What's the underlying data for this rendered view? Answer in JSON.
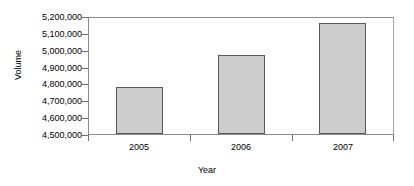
{
  "chart_data": {
    "type": "bar",
    "title": "",
    "xlabel": "Year",
    "ylabel": "Volume",
    "categories": [
      "2005",
      "2006",
      "2007"
    ],
    "values": [
      4783000,
      4978000,
      5170000
    ],
    "series": [
      {
        "name": "Volume",
        "values": [
          4783000,
          4978000,
          5170000
        ]
      }
    ],
    "ylim": [
      4500000,
      5200000
    ],
    "ytick_values": [
      4500000,
      4600000,
      4700000,
      4800000,
      4900000,
      5000000,
      5100000,
      5200000
    ],
    "ytick_labels": [
      "4,500,000",
      "4,600,000",
      "4,700,000",
      "4,800,000",
      "4,900,000",
      "5,000,000",
      "5,100,000",
      "5,200,000"
    ],
    "xtick_labels": [
      "2005",
      "2006",
      "2007"
    ],
    "grid": false,
    "legend": false,
    "legend_position": "none",
    "bar_fill_color": "#cdcdcd",
    "bar_border_color": "#595959",
    "axis_color": "#8a8a8a",
    "background_color": "#ffffff",
    "text_color": "#000000"
  },
  "axes": {
    "y_title": "Volume",
    "x_title": "Year",
    "y_labels": {
      "t0": "4,500,000",
      "t1": "4,600,000",
      "t2": "4,700,000",
      "t3": "4,800,000",
      "t4": "4,900,000",
      "t5": "5,000,000",
      "t6": "5,100,000",
      "t7": "5,200,000"
    },
    "x_labels": {
      "c0": "2005",
      "c1": "2006",
      "c2": "2007"
    }
  }
}
